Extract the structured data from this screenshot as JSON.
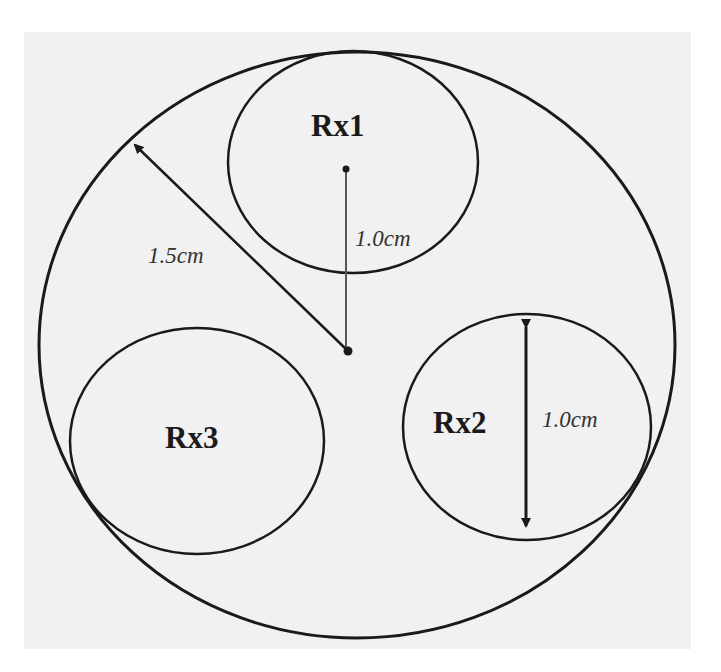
{
  "diagram": {
    "title": "",
    "colors": {
      "background": "#f1f1f1",
      "stroke": "#1a1a1a",
      "page": "#ffffff"
    },
    "outer_circle": {
      "cx": 357,
      "cy": 345,
      "rx": 318,
      "ry": 293,
      "radius_label": "1.5cm"
    },
    "receivers": [
      {
        "id": "Rx1",
        "label": "Rx1",
        "cx": 353,
        "cy": 162,
        "rx": 125,
        "ry": 111,
        "dimension_label": "1.0cm",
        "dimension_type": "center-to-center distance"
      },
      {
        "id": "Rx2",
        "label": "Rx2",
        "cx": 527,
        "cy": 427,
        "rx": 124,
        "ry": 113,
        "dimension_label": "1.0cm",
        "dimension_type": "diameter"
      },
      {
        "id": "Rx3",
        "label": "Rx3",
        "cx": 197,
        "cy": 441,
        "rx": 127,
        "ry": 113
      }
    ],
    "labels": {
      "rx1": "Rx1",
      "rx2": "Rx2",
      "rx3": "Rx3",
      "outer_radius": "1.5cm",
      "rx1_offset": "1.0cm",
      "rx2_diameter": "1.0cm"
    }
  }
}
